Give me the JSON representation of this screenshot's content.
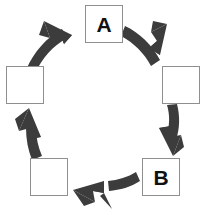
{
  "diagram": {
    "type": "circular-cycle",
    "title": "",
    "background_color": "#ffffff",
    "arrow_color": "#3c3c3c",
    "box_fill_color": "#ffffff",
    "box_border_color": "#8f8f8f",
    "label_color": "#111111",
    "flow_direction": "counter-clockwise",
    "node_count": 6,
    "arrow_count": 6,
    "nodes": [
      {
        "id": "node-top",
        "label": "A",
        "position": "top",
        "x": 85,
        "y": 5,
        "width": 38,
        "height": 38
      },
      {
        "id": "node-upper-right",
        "label": "",
        "position": "upper-right",
        "x": 162,
        "y": 66,
        "width": 38,
        "height": 38
      },
      {
        "id": "node-lower-right",
        "label": "B",
        "position": "lower-right",
        "x": 142,
        "y": 158,
        "width": 38,
        "height": 38
      },
      {
        "id": "node-bottom-left",
        "label": "",
        "position": "lower-left",
        "x": 30,
        "y": 158,
        "width": 38,
        "height": 38
      },
      {
        "id": "node-upper-left",
        "label": "",
        "position": "upper-left",
        "x": 6,
        "y": 66,
        "width": 38,
        "height": 38
      }
    ],
    "arrows": [
      {
        "id": "arrow-top-left",
        "from": "node-upper-left",
        "to": "node-top",
        "direction": "up-right"
      },
      {
        "id": "arrow-top-right",
        "from": "node-top",
        "to": "node-upper-right",
        "direction": "down-right"
      },
      {
        "id": "arrow-right",
        "from": "node-upper-right",
        "to": "node-lower-right",
        "direction": "down"
      },
      {
        "id": "arrow-bottom",
        "from": "node-lower-right",
        "to": "node-bottom-left",
        "direction": "left"
      },
      {
        "id": "arrow-left",
        "from": "node-bottom-left",
        "to": "node-upper-left",
        "direction": "up"
      }
    ]
  }
}
